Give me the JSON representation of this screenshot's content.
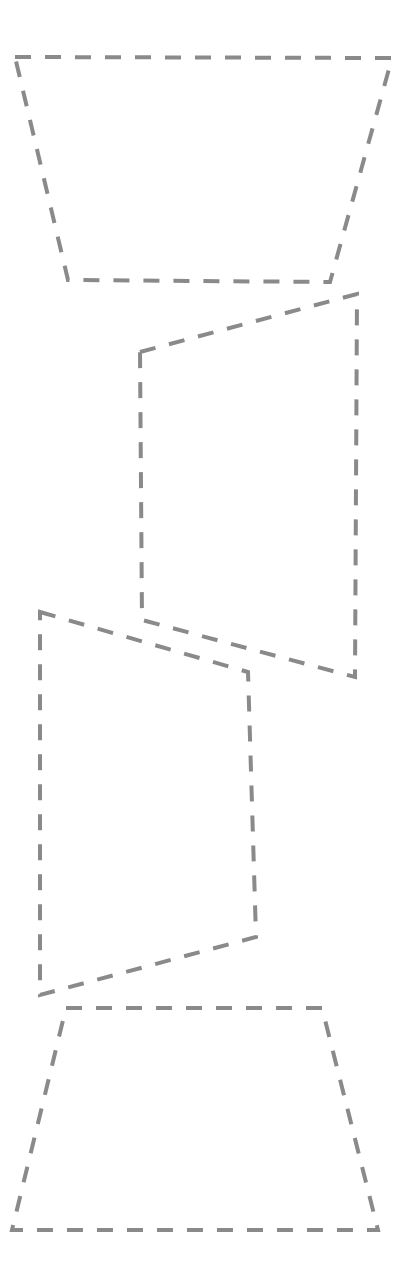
{
  "canvas": {
    "width": 416,
    "height": 1283,
    "background_color": "#ffffff",
    "title": "Dashed region outlines"
  },
  "style": {
    "stroke_color": "#8a8a8a",
    "stroke_width": 4,
    "dash_length": 16,
    "gap_length": 14,
    "line_style": "dashed"
  },
  "regions": [
    {
      "id": "region-1",
      "label": "Region 1",
      "shape": "quadrilateral",
      "points": "15,57 392,58 330,282 68,280",
      "corners": [
        {
          "name": "top-left",
          "x": 15,
          "y": 57
        },
        {
          "name": "top-right",
          "x": 392,
          "y": 58
        },
        {
          "name": "bottom-right",
          "x": 330,
          "y": 282
        },
        {
          "name": "bottom-left",
          "x": 68,
          "y": 280
        }
      ]
    },
    {
      "id": "region-2",
      "label": "Region 2",
      "shape": "quadrilateral",
      "points": "140,352 357,294 355,677 142,620",
      "corners": [
        {
          "name": "top-left",
          "x": 140,
          "y": 352
        },
        {
          "name": "top-right",
          "x": 357,
          "y": 294
        },
        {
          "name": "bottom-right",
          "x": 355,
          "y": 677
        },
        {
          "name": "bottom-left",
          "x": 142,
          "y": 620
        }
      ]
    },
    {
      "id": "region-3",
      "label": "Region 3",
      "shape": "quadrilateral",
      "points": "40,612 248,672 256,937 40,995",
      "corners": [
        {
          "name": "top-left",
          "x": 40,
          "y": 612
        },
        {
          "name": "top-right",
          "x": 248,
          "y": 672
        },
        {
          "name": "bottom-right",
          "x": 256,
          "y": 937
        },
        {
          "name": "bottom-left",
          "x": 40,
          "y": 995
        }
      ]
    },
    {
      "id": "region-4",
      "label": "Region 4",
      "shape": "quadrilateral",
      "points": "66,1008 322,1008 378,1230 12,1230",
      "corners": [
        {
          "name": "top-left",
          "x": 66,
          "y": 1008
        },
        {
          "name": "top-right",
          "x": 322,
          "y": 1008
        },
        {
          "name": "bottom-right",
          "x": 378,
          "y": 1230
        },
        {
          "name": "bottom-left",
          "x": 12,
          "y": 1230
        }
      ]
    }
  ]
}
